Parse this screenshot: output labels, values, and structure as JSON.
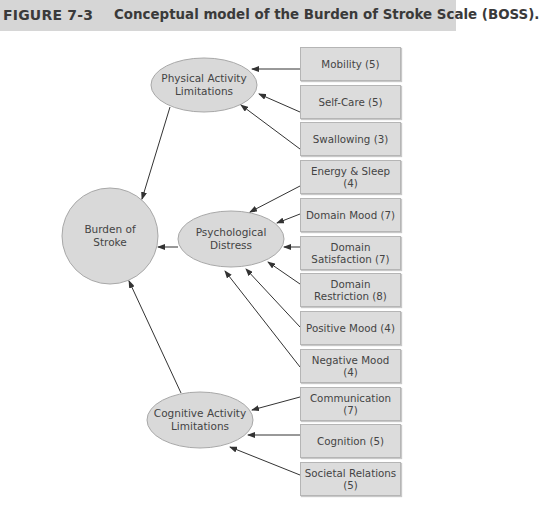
{
  "header": {
    "figure_number": "FIGURE 7-3",
    "title": "Conceptual model of the Burden of Stroke Scale (BOSS)."
  },
  "nodes": {
    "burden": "Burden of Stroke",
    "physical": "Physical Activity Limitations",
    "psychological": "Psychological Distress",
    "cognitive": "Cognitive Activity Limitations"
  },
  "boxes": [
    {
      "label": "Mobility (5)",
      "target": "physical"
    },
    {
      "label": "Self-Care (5)",
      "target": "physical"
    },
    {
      "label": "Swallowing (3)",
      "target": "physical"
    },
    {
      "label": "Energy & Sleep (4)",
      "target": "psychological"
    },
    {
      "label": "Domain Mood (7)",
      "target": "psychological"
    },
    {
      "label": "Domain Satisfaction (7)",
      "target": "psychological"
    },
    {
      "label": "Domain Restriction (8)",
      "target": "psychological"
    },
    {
      "label": "Positive Mood (4)",
      "target": "psychological"
    },
    {
      "label": "Negative Mood (4)",
      "target": "psychological"
    },
    {
      "label": "Communication (7)",
      "target": "cognitive"
    },
    {
      "label": "Cognition (5)",
      "target": "cognitive"
    },
    {
      "label": "Societal Relations (5)",
      "target": "cognitive"
    }
  ],
  "colors": {
    "header_bg": "#d6d6d6",
    "node_fill": "#d9d9d9",
    "box_fill": "#dcdcdc",
    "line": "#333333"
  }
}
